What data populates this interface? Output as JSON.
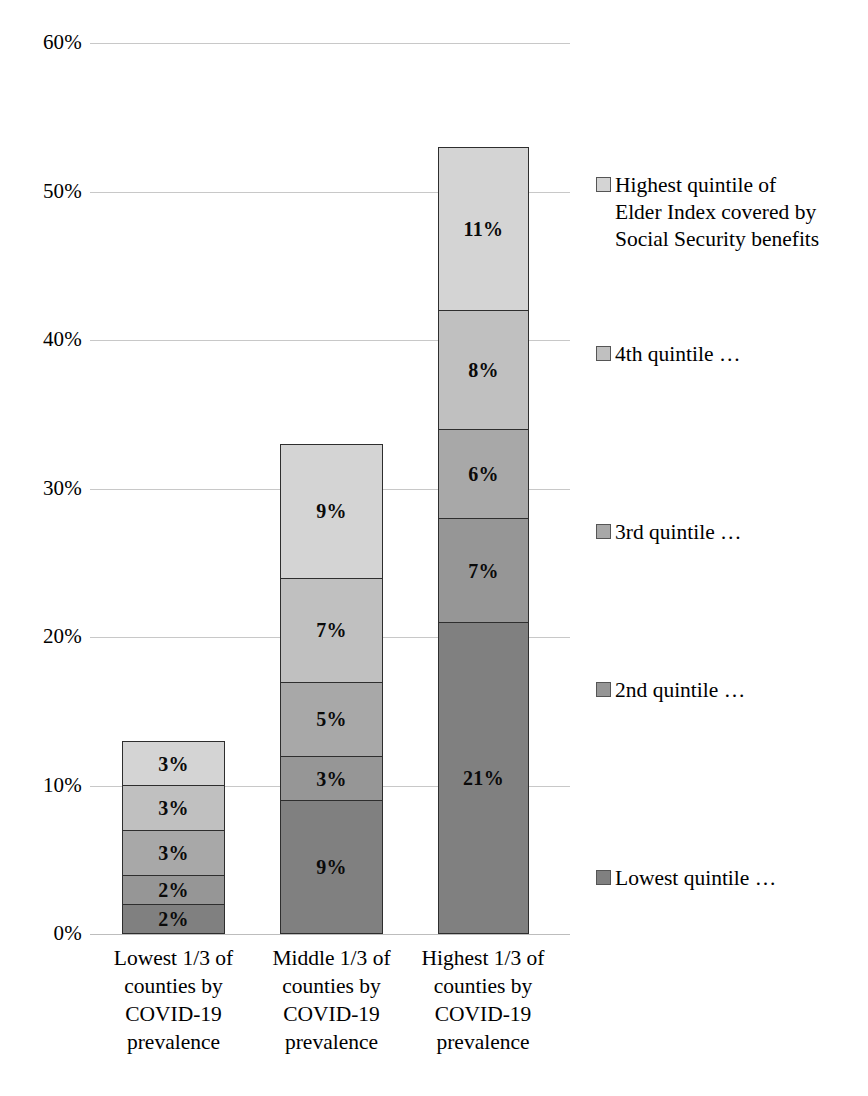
{
  "chart_data": {
    "type": "bar",
    "subtype": "stacked-column",
    "title": "",
    "xlabel": "",
    "ylabel": "",
    "ylim": [
      0,
      60
    ],
    "ytick_labels": [
      "0%",
      "10%",
      "20%",
      "30%",
      "40%",
      "50%",
      "60%"
    ],
    "ytick_values": [
      0,
      10,
      20,
      30,
      40,
      50,
      60
    ],
    "grid": true,
    "legend_position": "right",
    "categories": [
      "Lowest 1/3 of\ncounties by\nCOVID-19\nprevalence",
      "Middle 1/3 of\ncounties by\nCOVID-19\nprevalence",
      "Highest 1/3 of\ncounties by\nCOVID-19\nprevalence"
    ],
    "series": [
      {
        "name": "Lowest quintile …",
        "legend_label": "Lowest quintile …",
        "color": "#808080",
        "values": [
          2,
          9,
          21
        ],
        "data_labels": [
          "2%",
          "9%",
          "21%"
        ]
      },
      {
        "name": "2nd quintile …",
        "legend_label": "2nd quintile …",
        "color": "#969696",
        "values": [
          2,
          3,
          7
        ],
        "data_labels": [
          "2%",
          "3%",
          "7%"
        ]
      },
      {
        "name": "3rd quintile …",
        "legend_label": "3rd quintile …",
        "color": "#a8a8a8",
        "values": [
          3,
          5,
          6
        ],
        "data_labels": [
          "3%",
          "5%",
          "6%"
        ]
      },
      {
        "name": "4th quintile …",
        "legend_label": "4th quintile …",
        "color": "#c0c0c0",
        "values": [
          3,
          7,
          8
        ],
        "data_labels": [
          "3%",
          "7%",
          "8%"
        ]
      },
      {
        "name": "Highest quintile of Elder Index covered by Social Security benefits",
        "legend_label": "Highest quintile of\nElder Index covered by\nSocial Security benefits",
        "color": "#d4d4d4",
        "values": [
          3,
          9,
          11
        ],
        "data_labels": [
          "3%",
          "9%",
          "11%"
        ]
      }
    ],
    "totals": [
      13,
      33,
      53
    ]
  },
  "axis": {
    "ticks": [
      {
        "label": "60%",
        "value": 60
      },
      {
        "label": "50%",
        "value": 50
      },
      {
        "label": "40%",
        "value": 40
      },
      {
        "label": "30%",
        "value": 30
      },
      {
        "label": "20%",
        "value": 20
      },
      {
        "label": "10%",
        "value": 10
      },
      {
        "label": "0%",
        "value": 0
      }
    ]
  },
  "legend": {
    "items": [
      {
        "label": "Highest quintile of\nElder Index covered by\nSocial Security benefits",
        "color": "#d4d4d4",
        "top": 172
      },
      {
        "label": "4th quintile …",
        "color": "#c0c0c0",
        "top": 341
      },
      {
        "label": "3rd quintile …",
        "color": "#a8a8a8",
        "top": 519
      },
      {
        "label": "2nd quintile …",
        "color": "#969696",
        "top": 677
      },
      {
        "label": "Lowest quintile …",
        "color": "#808080",
        "top": 865
      }
    ]
  }
}
